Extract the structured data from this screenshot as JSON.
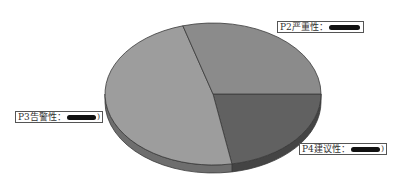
{
  "chart_data": {
    "type": "pie",
    "style": "3d-tilted",
    "title": "",
    "categories": [
      "P2严重性",
      "P3告警性",
      "P4建议性"
    ],
    "values": [
      29.5,
      48.3,
      22.2
    ],
    "value_display": "redacted",
    "colors": {
      "P2严重性": "#8b8b8b",
      "P3告警性": "#9d9d9d",
      "P4建议性": "#616161"
    },
    "side_colors": {
      "P2严重性": "#5e5e5e",
      "P3告警性": "#6e6e6e",
      "P4建议性": "#444444"
    },
    "legend": "none",
    "slice_order_note": "P4 from 3 o'clock clockwise; P3 from bottom around left; P2 from top back to 3 o'clock"
  },
  "labels": [
    {
      "text": "P2严重性：",
      "suffix": "",
      "redact_width": 38
    },
    {
      "text": "P3告警性：",
      "suffix": ")",
      "redact_width": 38
    },
    {
      "text": "P4建议性：",
      "suffix": ")",
      "redact_width": 36
    }
  ],
  "colors": {
    "outline": "#3a3a3a",
    "label_border": "#555555",
    "background": "#ffffff"
  }
}
